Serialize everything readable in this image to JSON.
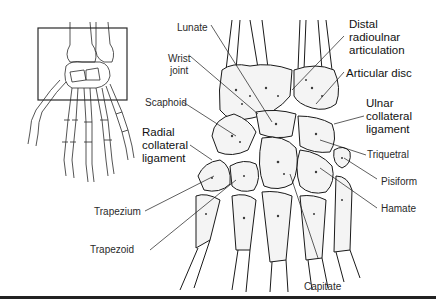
{
  "figure": {
    "inset": {
      "description": "Hand skeleton with boxed wrist region"
    },
    "labels": {
      "lunate": "Lunate",
      "wrist_joint_1": "Wrist",
      "wrist_joint_2": "joint",
      "scaphoid": "Scaphoid",
      "radial_collateral_1": "Radial",
      "radial_collateral_2": "collateral",
      "radial_collateral_3": "ligament",
      "trapezium": "Trapezium",
      "trapezoid": "Trapezoid",
      "capitate": "Capitate",
      "distal_radioulnar_1": "Distal",
      "distal_radioulnar_2": "radioulnar",
      "distal_radioulnar_3": "articulation",
      "articular_disc": "Articular disc",
      "ulnar_collateral_1": "Ulnar",
      "ulnar_collateral_2": "collateral",
      "ulnar_collateral_3": "ligament",
      "triquetral": "Triquetral",
      "pisiform": "Pisiform",
      "hamate": "Hamate"
    },
    "colors": {
      "line": "#1a1a1a",
      "bone_fill": "#f4f4f4",
      "spongy": "#3a3a3a",
      "rule": "#222222"
    }
  }
}
